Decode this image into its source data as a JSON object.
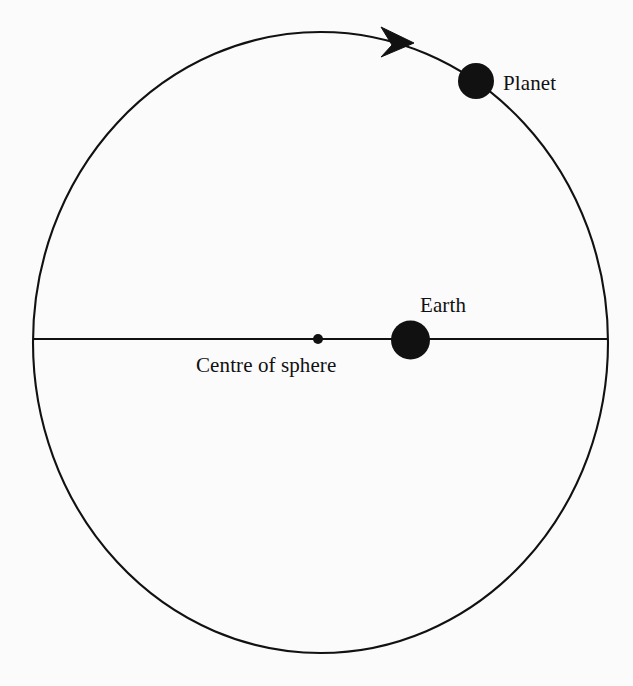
{
  "diagram": {
    "type": "astronomy-schematic",
    "background_color": "#fbfbfc",
    "stroke_color": "#111111",
    "fill_color": "#111111",
    "labels": {
      "planet": "Planet",
      "earth": "Earth",
      "centre": "Centre of sphere"
    },
    "geometry": {
      "sphere": {
        "name": "celestial-sphere-outline",
        "cx": 320.5,
        "cy": 342.5,
        "rx": 287.5,
        "ry": 310.5,
        "stroke_width": 2.1
      },
      "equator_line": {
        "name": "horizontal-diameter-line",
        "x1": 33,
        "y1": 339,
        "x2": 608,
        "y2": 339,
        "stroke_width": 2.0
      },
      "centre_dot": {
        "name": "centre-of-sphere-dot",
        "cx": 318,
        "cy": 339,
        "r": 5
      },
      "earth_body": {
        "name": "earth-body",
        "cx": 410.5,
        "cy": 340,
        "r": 19.5
      },
      "planet_body": {
        "name": "planet-body",
        "cx": 476,
        "cy": 81,
        "r": 18
      },
      "direction_arrow": {
        "name": "orbit-direction-arrow",
        "tip_x": 414,
        "tip_y": 43,
        "points": "414,43 381,27 392,45 381,57",
        "direction": "clockwise"
      }
    },
    "label_positions": {
      "planet": {
        "x": 503,
        "y": 90,
        "anchor": "start"
      },
      "earth": {
        "x": 420,
        "y": 312,
        "anchor": "start"
      },
      "centre": {
        "x": 196,
        "y": 372,
        "anchor": "start"
      }
    }
  }
}
